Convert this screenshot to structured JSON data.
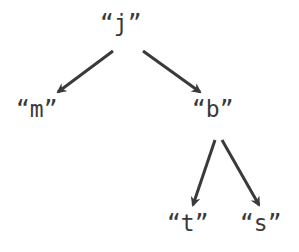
{
  "tree": {
    "root": {
      "label": "“j”"
    },
    "nodes": [
      {
        "id": "j",
        "label": "“j”"
      },
      {
        "id": "m",
        "label": "“m”"
      },
      {
        "id": "b",
        "label": "“b”"
      },
      {
        "id": "t",
        "label": "“t”"
      },
      {
        "id": "s",
        "label": "“s”"
      }
    ],
    "edges": [
      {
        "from": "j",
        "to": "m"
      },
      {
        "from": "j",
        "to": "b"
      },
      {
        "from": "b",
        "to": "t"
      },
      {
        "from": "b",
        "to": "s"
      }
    ]
  },
  "colors": {
    "stroke": "#3a3a3a",
    "text": "#3a3a3a",
    "background": "#ffffff"
  }
}
